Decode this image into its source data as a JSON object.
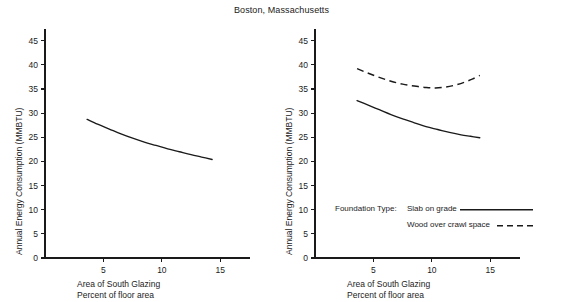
{
  "chart_data": [
    {
      "type": "line",
      "panel": "left",
      "title": "Boston, Massachusetts",
      "xlabel": "Area of South Glazing",
      "xlabel_line2": "Percent of floor area",
      "ylabel": "Annual Energy Consumption (MMBTU)",
      "xlim": [
        0,
        16
      ],
      "ylim": [
        0,
        47
      ],
      "xticks": [
        5,
        10,
        15
      ],
      "yticks": [
        0,
        5,
        10,
        15,
        20,
        25,
        30,
        35,
        40,
        45
      ],
      "grid": false,
      "legend": null,
      "series": [
        {
          "name": "Annual energy consumption",
          "style": "solid",
          "color": "#1a1a1a",
          "x": [
            3.6,
            4.5,
            5.5,
            6.5,
            7.5,
            8.5,
            9.5,
            10.5,
            11.5,
            12.5,
            13.4,
            14.3
          ],
          "values": [
            28.7,
            27.7,
            26.7,
            25.7,
            24.8,
            24.0,
            23.3,
            22.6,
            22.0,
            21.4,
            20.9,
            20.4
          ]
        }
      ]
    },
    {
      "type": "line",
      "panel": "right",
      "title": "Boston, Massachusetts",
      "xlabel": "Area of South Glazing",
      "xlabel_line2": "Percent of floor area",
      "ylabel": "Annual Energy Consumption (MMBTU)",
      "xlim": [
        0,
        16
      ],
      "ylim": [
        0,
        47
      ],
      "xticks": [
        5,
        10,
        15
      ],
      "yticks": [
        0,
        5,
        10,
        15,
        20,
        25,
        30,
        35,
        40,
        45
      ],
      "grid": false,
      "legend": {
        "position": "inside-lower-right",
        "title": "Foundation Type:",
        "entries": [
          {
            "label": "Slab on grade",
            "style": "solid"
          },
          {
            "label": "Wood over crawl space",
            "style": "dashed"
          }
        ]
      },
      "series": [
        {
          "name": "Slab on grade",
          "style": "solid",
          "color": "#1a1a1a",
          "x": [
            3.6,
            4.5,
            5.5,
            6.5,
            7.5,
            8.5,
            9.5,
            10.5,
            11.5,
            12.5,
            13.3,
            14.1
          ],
          "values": [
            32.6,
            31.7,
            30.7,
            29.7,
            28.8,
            28.0,
            27.2,
            26.6,
            26.0,
            25.5,
            25.2,
            24.9
          ]
        },
        {
          "name": "Wood over crawl space",
          "style": "dashed",
          "color": "#1a1a1a",
          "x": [
            3.6,
            4.5,
            5.5,
            6.5,
            7.5,
            8.5,
            9.5,
            10.3,
            11.2,
            12.0,
            12.8,
            13.5,
            14.1
          ],
          "values": [
            39.2,
            38.3,
            37.4,
            36.6,
            36.0,
            35.6,
            35.3,
            35.2,
            35.4,
            35.8,
            36.4,
            37.1,
            37.8
          ]
        }
      ]
    }
  ],
  "figure": {
    "title": "Boston, Massachusetts"
  },
  "left_panel": {
    "ylabel": "Annual Energy Consumption (MMBTU)",
    "xlabel_line1": "Area of South Glazing",
    "xlabel_line2": "Percent of floor area",
    "ytick_labels": [
      "45",
      "40",
      "35",
      "30",
      "25",
      "20",
      "15",
      "10",
      "5",
      "0"
    ],
    "xtick_labels": [
      "5",
      "10",
      "15"
    ]
  },
  "right_panel": {
    "ylabel": "Annual Energy Consumption (MMBTU)",
    "xlabel_line1": "Area of South Glazing",
    "xlabel_line2": "Percent of floor area",
    "ytick_labels": [
      "45",
      "40",
      "35",
      "30",
      "25",
      "20",
      "15",
      "10",
      "5",
      "0"
    ],
    "xtick_labels": [
      "5",
      "10",
      "15"
    ],
    "legend": {
      "title": "Foundation Type:",
      "entry1": "Slab on grade",
      "entry2": "Wood over crawl space"
    }
  }
}
